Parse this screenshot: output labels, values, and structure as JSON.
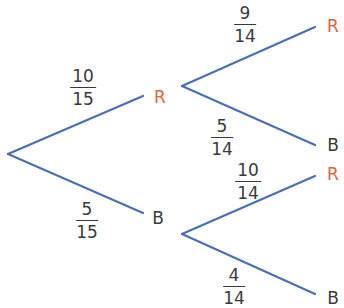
{
  "colors": {
    "branch": "#4a6fb5",
    "red_outcome": "#e0643a",
    "blue_outcome": "#3a3a3a",
    "text": "#3a3a3a"
  },
  "tree": {
    "first_stage": {
      "R": {
        "label": "R",
        "probability": {
          "num": "10",
          "den": "15"
        }
      },
      "B": {
        "label": "B",
        "probability": {
          "num": "5",
          "den": "15"
        }
      }
    },
    "second_stage": {
      "after_R": {
        "R": {
          "label": "R",
          "probability": {
            "num": "9",
            "den": "14"
          }
        },
        "B": {
          "label": "B",
          "probability": {
            "num": "5",
            "den": "14"
          }
        }
      },
      "after_B": {
        "R": {
          "label": "R",
          "probability": {
            "num": "10",
            "den": "14"
          }
        },
        "B": {
          "label": "B",
          "probability": {
            "num": "4",
            "den": "14"
          }
        }
      }
    }
  }
}
